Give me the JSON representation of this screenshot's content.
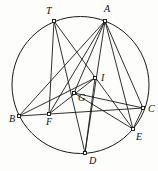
{
  "figure": {
    "kind": "geometry-diagram",
    "width": 158,
    "height": 171,
    "background_color": "#fdfdfb",
    "ink_color": "#1a1a1a",
    "marker_fill": "#ffffff"
  },
  "circle": {
    "name": "circumcircle",
    "cx": 80.5,
    "cy": 85,
    "r": 68.5
  },
  "points": [
    {
      "id": "T",
      "label": "T",
      "x": 54,
      "y": 21,
      "on_circle": true,
      "label_x": 46,
      "label_y": 14
    },
    {
      "id": "A",
      "label": "A",
      "x": 105,
      "y": 21,
      "on_circle": true,
      "label_x": 104,
      "label_y": 12
    },
    {
      "id": "B",
      "label": "B",
      "x": 19,
      "y": 116,
      "on_circle": true,
      "label_x": 9,
      "label_y": 122
    },
    {
      "id": "C",
      "label": "C",
      "x": 143,
      "y": 108,
      "on_circle": true,
      "label_x": 148,
      "label_y": 112
    },
    {
      "id": "D",
      "label": "D",
      "x": 85,
      "y": 153,
      "on_circle": true,
      "label_x": 89,
      "label_y": 164
    },
    {
      "id": "E",
      "label": "E",
      "x": 133,
      "y": 129,
      "on_circle": true,
      "label_x": 136,
      "label_y": 140
    },
    {
      "id": "F",
      "label": "F",
      "x": 49,
      "y": 114,
      "on_circle": false,
      "label_x": 46,
      "label_y": 125
    },
    {
      "id": "G",
      "label": "G",
      "x": 74,
      "y": 93,
      "on_circle": false,
      "label_x": 78,
      "label_y": 101
    },
    {
      "id": "I",
      "label": "I",
      "x": 95,
      "y": 78,
      "on_circle": false,
      "label_x": 101,
      "label_y": 81
    }
  ],
  "segments": [
    {
      "name": "segment-T-F",
      "from": "T",
      "to": "F"
    },
    {
      "name": "segment-T-D",
      "from": "T",
      "to": "D"
    },
    {
      "name": "segment-T-E",
      "from": "T",
      "to": "E"
    },
    {
      "name": "segment-A-B",
      "from": "A",
      "to": "B"
    },
    {
      "name": "segment-A-F",
      "from": "A",
      "to": "F"
    },
    {
      "name": "segment-A-G",
      "from": "A",
      "to": "G"
    },
    {
      "name": "segment-A-D",
      "from": "A",
      "to": "D"
    },
    {
      "name": "segment-A-E",
      "from": "A",
      "to": "E"
    },
    {
      "name": "segment-A-C",
      "from": "A",
      "to": "C"
    },
    {
      "name": "segment-B-C",
      "from": "B",
      "to": "C"
    },
    {
      "name": "segment-B-I",
      "from": "B",
      "to": "I"
    },
    {
      "name": "segment-F-I",
      "from": "F",
      "to": "I"
    },
    {
      "name": "segment-G-E",
      "from": "G",
      "to": "E"
    },
    {
      "name": "segment-G-C",
      "from": "G",
      "to": "C"
    },
    {
      "name": "segment-C-E",
      "from": "C",
      "to": "E"
    },
    {
      "name": "segment-D-I",
      "from": "D",
      "to": "I"
    }
  ]
}
